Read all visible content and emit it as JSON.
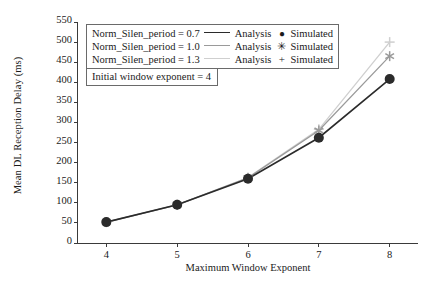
{
  "chart_data": {
    "type": "line",
    "title": "",
    "xlabel": "Maximum Window Exponent",
    "ylabel": "Mean DL Reception Delay (ms)",
    "x": [
      4,
      5,
      6,
      7,
      8
    ],
    "xlim": [
      3.6,
      8.4
    ],
    "ylim": [
      0,
      550
    ],
    "xticks": [
      "4",
      "5",
      "6",
      "7",
      "8"
    ],
    "yticks": [
      "0",
      "50",
      "100",
      "150",
      "200",
      "250",
      "300",
      "350",
      "400",
      "450",
      "500",
      "550"
    ],
    "grid": false,
    "legend_position": "upper-left",
    "series": [
      {
        "name": "Norm_Silen_period = 0.7",
        "analysis_label": "Analysis",
        "simulated_label": "Simulated",
        "marker": "circle",
        "marker_glyph": "●",
        "color": "#2b2b2b",
        "values": [
          52,
          95,
          160,
          262,
          408
        ]
      },
      {
        "name": "Norm_Silen_period = 1.0",
        "analysis_label": "Analysis",
        "simulated_label": "Simulated",
        "marker": "asterisk",
        "marker_glyph": "✳",
        "color": "#9a9a9a",
        "values": [
          52,
          95,
          162,
          280,
          465
        ]
      },
      {
        "name": "Norm_Silen_period = 1.3",
        "analysis_label": "Analysis",
        "simulated_label": "Simulated",
        "marker": "plus",
        "marker_glyph": "+",
        "color": "#cfcfcf",
        "values": [
          52,
          95,
          163,
          283,
          500
        ]
      }
    ],
    "annotation": "Initial window exponent = 4"
  }
}
